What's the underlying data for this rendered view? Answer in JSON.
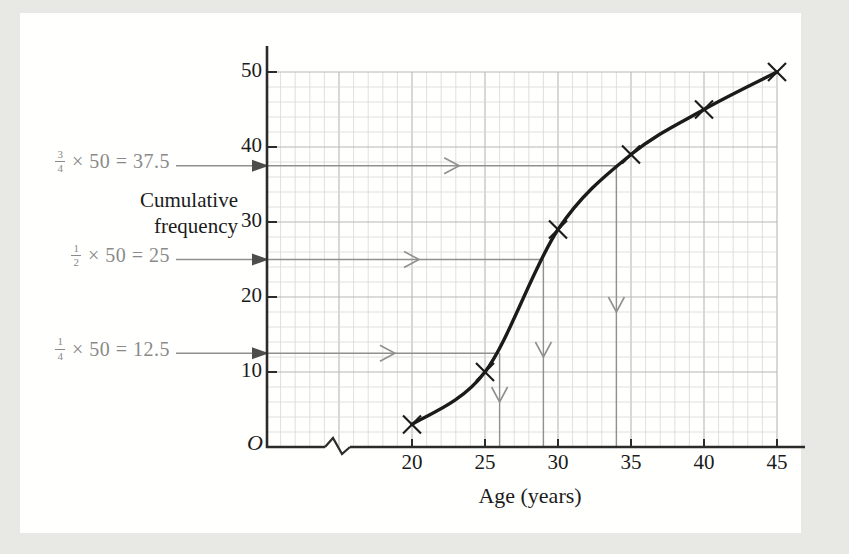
{
  "figure": {
    "kind": "cumulative-frequency-ogive",
    "page_background": "#e8e8e5",
    "card_background": "#fffffd"
  },
  "chart_data": {
    "type": "line",
    "title": "",
    "xlabel": "Age (years)",
    "ylabel": "Cumulative frequency",
    "ylabel_lines": [
      "Cumulative",
      "frequency"
    ],
    "origin_label": "O",
    "x": [
      20,
      25,
      30,
      35,
      40,
      45
    ],
    "values": [
      3,
      10,
      29,
      39,
      45,
      50
    ],
    "x_ticks": [
      "20",
      "25",
      "30",
      "35",
      "40",
      "45"
    ],
    "y_ticks": [
      "10",
      "20",
      "30",
      "40",
      "50"
    ],
    "xlim": [
      10,
      47
    ],
    "ylim": [
      0,
      50
    ],
    "marker": "x",
    "grid": "on",
    "axis_break_on_x": true,
    "annotations": [
      {
        "id": "upper-quartile",
        "num": "3",
        "den": "4",
        "expr": "× 50 = 37.5",
        "value": 37.5,
        "age_at_value": 34
      },
      {
        "id": "median",
        "num": "1",
        "den": "2",
        "expr": "× 50 = 25",
        "value": 25,
        "age_at_value": 29
      },
      {
        "id": "lower-quartile",
        "num": "1",
        "den": "4",
        "expr": "× 50 = 12.5",
        "value": 12.5,
        "age_at_value": 26
      }
    ]
  },
  "colors": {
    "curve": "#1b1b1b",
    "marker": "#1b1b1b",
    "axis": "#2b2b2b",
    "grid_minor": "#d8d8d5",
    "grid_major": "#b7b7b4",
    "annotation_line": "#909090",
    "annotation_arrowhead": "#4d4d4d",
    "annotation_text": "#8a8a8a",
    "text": "#1b1b1b"
  }
}
